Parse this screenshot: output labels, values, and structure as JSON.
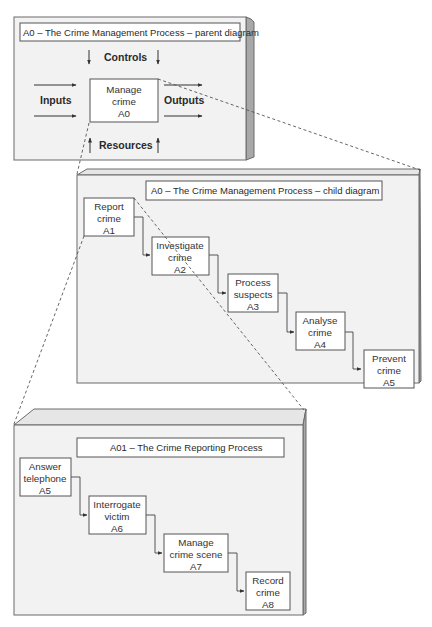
{
  "parent_diagram": {
    "title": "A0 – The Crime Management Process – parent diagram",
    "labels": {
      "controls": "Controls",
      "inputs": "Inputs",
      "outputs": "Outputs",
      "resources": "Resources"
    },
    "process": {
      "line1": "Manage",
      "line2": "crime",
      "code": "A0"
    }
  },
  "child_diagram": {
    "title": "A0 – The Crime Management Process – child diagram",
    "processes": [
      {
        "line1": "Report",
        "line2": "crime",
        "code": "A1"
      },
      {
        "line1": "Investigate",
        "line2": "crime",
        "code": "A2"
      },
      {
        "line1": "Process",
        "line2": "suspects",
        "code": "A3"
      },
      {
        "line1": "Analyse",
        "line2": "crime",
        "code": "A4"
      },
      {
        "line1": "Prevent",
        "line2": "crime",
        "code": "A5"
      }
    ]
  },
  "reporting_diagram": {
    "title": "A01 – The Crime Reporting Process",
    "processes": [
      {
        "line1": "Answer",
        "line2": "telephone",
        "code": "A5"
      },
      {
        "line1": "Interrogate",
        "line2": "victim",
        "code": "A6"
      },
      {
        "line1": "Manage",
        "line2": "crime scene",
        "code": "A7"
      },
      {
        "line1": "Record",
        "line2": "crime",
        "code": "A8"
      }
    ]
  },
  "colors": {
    "panel_face": "#f2f2f2",
    "panel_side": "#a8a8a8",
    "box_fill": "#ffffff",
    "line": "#444444"
  }
}
